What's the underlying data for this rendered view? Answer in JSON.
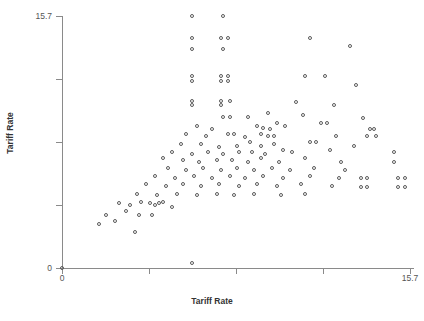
{
  "chart_data": {
    "type": "scatter",
    "title": "",
    "xlabel": "Tariff Rate",
    "ylabel": "Tariff Rate",
    "xlim": [
      0,
      15.7
    ],
    "ylim": [
      0,
      15.7
    ],
    "grid": false,
    "legend": false,
    "xticks": [
      0,
      3.925,
      7.85,
      11.775,
      15.7
    ],
    "yticks": [
      0,
      3.925,
      7.85,
      11.775,
      15.7
    ],
    "xtick_labels": [
      "0",
      "",
      "",
      "",
      "15.7"
    ],
    "ytick_labels": [
      "0",
      "",
      "",
      "",
      "15.7"
    ],
    "marker": "open-circle",
    "marker_color": "#5a5a5a",
    "points": [
      [
        0.0,
        0.0
      ],
      [
        5.9,
        15.7
      ],
      [
        7.3,
        15.7
      ],
      [
        5.9,
        14.3
      ],
      [
        7.2,
        14.3
      ],
      [
        7.5,
        14.3
      ],
      [
        11.2,
        14.3
      ],
      [
        13.0,
        13.8
      ],
      [
        5.9,
        13.6
      ],
      [
        7.3,
        13.6
      ],
      [
        5.9,
        11.9
      ],
      [
        5.9,
        11.6
      ],
      [
        7.2,
        11.9
      ],
      [
        7.5,
        11.9
      ],
      [
        7.2,
        11.6
      ],
      [
        7.5,
        11.6
      ],
      [
        11.0,
        11.9
      ],
      [
        11.9,
        11.9
      ],
      [
        13.3,
        11.4
      ],
      [
        5.9,
        10.4
      ],
      [
        5.9,
        10.1
      ],
      [
        7.2,
        10.4
      ],
      [
        7.2,
        10.1
      ],
      [
        7.6,
        10.4
      ],
      [
        10.6,
        10.3
      ],
      [
        12.3,
        10.1
      ],
      [
        7.3,
        9.4
      ],
      [
        7.6,
        9.4
      ],
      [
        8.4,
        9.4
      ],
      [
        9.3,
        9.6
      ],
      [
        10.9,
        9.5
      ],
      [
        11.7,
        9.0
      ],
      [
        12.0,
        9.0
      ],
      [
        13.6,
        9.3
      ],
      [
        6.1,
        8.8
      ],
      [
        6.8,
        8.6
      ],
      [
        8.8,
        8.8
      ],
      [
        9.1,
        8.7
      ],
      [
        9.4,
        8.6
      ],
      [
        9.7,
        9.0
      ],
      [
        10.1,
        8.8
      ],
      [
        13.9,
        8.6
      ],
      [
        14.1,
        8.6
      ],
      [
        5.6,
        8.3
      ],
      [
        6.5,
        8.2
      ],
      [
        7.5,
        8.3
      ],
      [
        7.8,
        8.3
      ],
      [
        8.3,
        8.1
      ],
      [
        9.0,
        8.3
      ],
      [
        9.3,
        8.2
      ],
      [
        9.6,
        8.2
      ],
      [
        12.4,
        8.2
      ],
      [
        13.8,
        8.2
      ],
      [
        14.2,
        8.2
      ],
      [
        5.4,
        7.7
      ],
      [
        6.3,
        7.7
      ],
      [
        7.1,
        7.5
      ],
      [
        7.9,
        7.6
      ],
      [
        8.5,
        7.8
      ],
      [
        9.0,
        7.6
      ],
      [
        9.6,
        7.7
      ],
      [
        11.2,
        7.8
      ],
      [
        11.5,
        7.8
      ],
      [
        13.2,
        7.6
      ],
      [
        5.0,
        7.2
      ],
      [
        5.9,
        7.1
      ],
      [
        6.6,
        7.2
      ],
      [
        7.3,
        7.1
      ],
      [
        8.0,
        7.2
      ],
      [
        8.6,
        7.2
      ],
      [
        9.2,
        7.1
      ],
      [
        10.0,
        7.3
      ],
      [
        10.4,
        7.2
      ],
      [
        12.1,
        7.3
      ],
      [
        15.0,
        7.2
      ],
      [
        4.6,
        6.8
      ],
      [
        5.5,
        6.7
      ],
      [
        6.2,
        6.6
      ],
      [
        7.0,
        6.7
      ],
      [
        7.7,
        6.7
      ],
      [
        8.4,
        6.6
      ],
      [
        9.0,
        6.8
      ],
      [
        9.8,
        6.6
      ],
      [
        11.0,
        6.8
      ],
      [
        12.6,
        6.6
      ],
      [
        15.0,
        6.6
      ],
      [
        4.8,
        6.2
      ],
      [
        5.6,
        6.1
      ],
      [
        6.4,
        6.2
      ],
      [
        7.2,
        6.1
      ],
      [
        7.9,
        6.2
      ],
      [
        8.7,
        6.1
      ],
      [
        9.5,
        6.2
      ],
      [
        10.3,
        6.1
      ],
      [
        11.4,
        6.2
      ],
      [
        12.8,
        6.1
      ],
      [
        4.2,
        5.7
      ],
      [
        5.1,
        5.6
      ],
      [
        6.0,
        5.7
      ],
      [
        6.8,
        5.6
      ],
      [
        7.6,
        5.7
      ],
      [
        8.3,
        5.6
      ],
      [
        9.1,
        5.7
      ],
      [
        10.0,
        5.6
      ],
      [
        11.2,
        5.7
      ],
      [
        12.5,
        5.6
      ],
      [
        13.5,
        5.6
      ],
      [
        13.8,
        5.6
      ],
      [
        15.2,
        5.6
      ],
      [
        15.5,
        5.6
      ],
      [
        3.8,
        5.2
      ],
      [
        4.7,
        5.1
      ],
      [
        5.5,
        5.2
      ],
      [
        6.3,
        5.1
      ],
      [
        7.1,
        5.2
      ],
      [
        8.0,
        5.1
      ],
      [
        8.8,
        5.2
      ],
      [
        9.7,
        5.1
      ],
      [
        10.8,
        5.2
      ],
      [
        12.2,
        5.1
      ],
      [
        13.5,
        5.0
      ],
      [
        13.8,
        5.0
      ],
      [
        15.2,
        5.0
      ],
      [
        15.5,
        5.0
      ],
      [
        3.4,
        4.6
      ],
      [
        4.3,
        4.5
      ],
      [
        5.2,
        4.6
      ],
      [
        6.1,
        4.5
      ],
      [
        7.0,
        4.6
      ],
      [
        7.8,
        4.5
      ],
      [
        8.7,
        4.6
      ],
      [
        9.9,
        4.5
      ],
      [
        11.0,
        4.6
      ],
      [
        2.6,
        4.0
      ],
      [
        3.1,
        3.9
      ],
      [
        3.6,
        4.1
      ],
      [
        4.0,
        4.0
      ],
      [
        4.2,
        3.9
      ],
      [
        4.4,
        4.0
      ],
      [
        4.6,
        4.1
      ],
      [
        5.0,
        3.8
      ],
      [
        2.0,
        3.3
      ],
      [
        2.9,
        3.5
      ],
      [
        3.5,
        3.3
      ],
      [
        4.1,
        3.3
      ],
      [
        1.7,
        2.7
      ],
      [
        2.4,
        2.9
      ],
      [
        3.3,
        2.2
      ],
      [
        5.9,
        0.3
      ]
    ]
  },
  "axes": {
    "x_title": "Tariff Rate",
    "y_title": "Tariff Rate",
    "x_min_label": "0",
    "x_max_label": "15.7",
    "y_min_label": "0",
    "y_max_label": "15.7"
  }
}
